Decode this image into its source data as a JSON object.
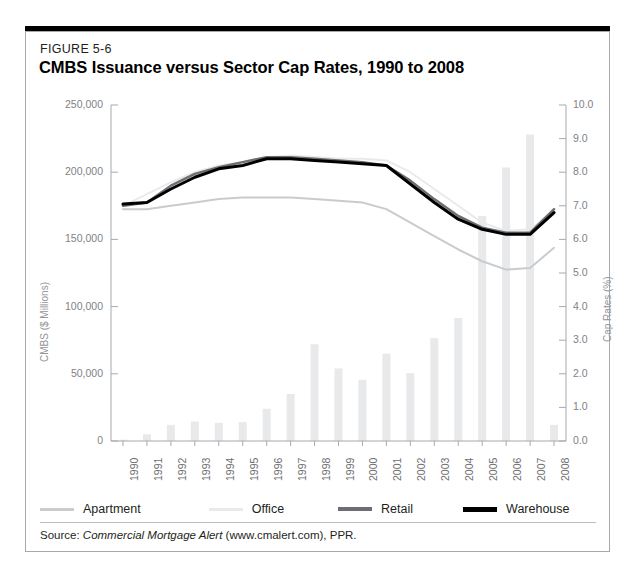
{
  "figure": {
    "number": "FIGURE 5-6",
    "title": "CMBS Issuance versus Sector Cap Rates, 1990 to 2008",
    "source_prefix": "Source: ",
    "source_italic": "Commercial Mortgage Alert",
    "source_suffix": " (www.cmalert.com), PPR."
  },
  "colors": {
    "apartment": "#c9cbcd",
    "office": "#e9eaeb",
    "retail": "#6d6e71",
    "warehouse": "#000000",
    "bar": "#e8e9ea",
    "axis": "#a7a9ac",
    "tick_text": "#808285",
    "frame_top": "#000000"
  },
  "chart_data": {
    "type": "bar",
    "title": "CMBS Issuance versus Sector Cap Rates, 1990 to 2008",
    "xlabel": "",
    "ylabel": "CMBS ($ Millions)",
    "y2label": "Cap Rates (%)",
    "grid": false,
    "legend_position": "bottom",
    "categories": [
      "1990",
      "1991",
      "1992",
      "1993",
      "1994",
      "1995",
      "1996",
      "1997",
      "1998",
      "1999",
      "2000",
      "2001",
      "2002",
      "2003",
      "2004",
      "2005",
      "2006",
      "2007",
      "2008"
    ],
    "ylim": [
      0,
      250000
    ],
    "yticks": [
      0,
      50000,
      100000,
      150000,
      200000,
      250000
    ],
    "ytick_labels": [
      "0",
      "50,000",
      "100,000",
      "150,000",
      "200,000",
      "250,000"
    ],
    "y2lim": [
      0,
      10
    ],
    "y2ticks": [
      0,
      1,
      2,
      3,
      4,
      5,
      6,
      7,
      8,
      9,
      10
    ],
    "y2tick_labels": [
      "0.0",
      "1.0",
      "2.0",
      "3.0",
      "4.0",
      "5.0",
      "6.0",
      "7.0",
      "8.0",
      "9.0",
      "10.0"
    ],
    "bars": {
      "name": "CMBS Issuance",
      "axis": "left",
      "units": "$ Millions",
      "values": [
        1000,
        5000,
        12000,
        14500,
        13500,
        14000,
        24000,
        35000,
        72000,
        54000,
        45500,
        65000,
        50500,
        76500,
        91500,
        167500,
        203500,
        228000,
        12000
      ]
    },
    "series": [
      {
        "name": "Apartment",
        "axis": "right",
        "units": "%",
        "color": "#c9cbcd",
        "values": [
          6.9,
          6.9,
          7.0,
          7.1,
          7.2,
          7.25,
          7.25,
          7.25,
          7.2,
          7.15,
          7.1,
          6.9,
          6.5,
          6.1,
          5.7,
          5.35,
          5.1,
          5.15,
          5.75
        ]
      },
      {
        "name": "Office",
        "axis": "right",
        "units": "%",
        "color": "#e9eaeb",
        "values": [
          7.0,
          7.35,
          7.7,
          8.0,
          8.2,
          8.3,
          8.45,
          8.5,
          8.45,
          8.4,
          8.4,
          8.35,
          8.0,
          7.5,
          7.0,
          6.5,
          6.25,
          6.3,
          6.85
        ]
      },
      {
        "name": "Retail",
        "axis": "right",
        "units": "%",
        "color": "#6d6e71",
        "values": [
          7.0,
          7.1,
          7.6,
          7.95,
          8.15,
          8.3,
          8.45,
          8.45,
          8.4,
          8.35,
          8.3,
          8.2,
          7.75,
          7.2,
          6.7,
          6.35,
          6.2,
          6.2,
          6.9
        ]
      },
      {
        "name": "Warehouse",
        "axis": "right",
        "units": "%",
        "color": "#000000",
        "values": [
          7.05,
          7.1,
          7.5,
          7.85,
          8.1,
          8.2,
          8.4,
          8.4,
          8.35,
          8.3,
          8.25,
          8.2,
          7.65,
          7.1,
          6.6,
          6.3,
          6.15,
          6.15,
          6.8
        ]
      }
    ],
    "legend": [
      {
        "label": "Apartment",
        "color": "#c9cbcd",
        "width": 3
      },
      {
        "label": "Office",
        "color": "#e9eaeb",
        "width": 3
      },
      {
        "label": "Retail",
        "color": "#6d6e71",
        "width": 4
      },
      {
        "label": "Warehouse",
        "color": "#000000",
        "width": 5
      }
    ]
  }
}
